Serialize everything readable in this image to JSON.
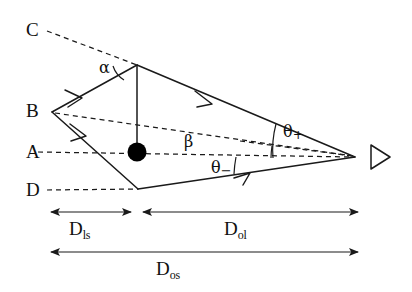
{
  "figure": {
    "type": "ray-diagram",
    "background_color": "#ffffff",
    "line_color": "#1a1a1a",
    "lens_color": "#000000",
    "width": 412,
    "height": 292
  },
  "plane_labels": {
    "c": "C",
    "b": "B",
    "a": "A",
    "d": "D"
  },
  "angle_labels": {
    "alpha": "α",
    "beta": "β",
    "theta_plus_symbol": "θ",
    "theta_plus_sign": "+",
    "theta_minus_symbol": "θ",
    "theta_minus_sign": "−"
  },
  "distance_labels": {
    "d_ls_main": "D",
    "d_ls_sub": "ls",
    "d_ol_main": "D",
    "d_ol_sub": "ol",
    "d_os_main": "D",
    "d_os_sub": "os"
  },
  "elements": {
    "lens_mass": "black-filled-circle-lens",
    "observer": "eye-triangle-observer",
    "source_ray_upper": "deflected-ray-upper",
    "source_ray_lower": "deflected-ray-lower",
    "optical_axis": "dashed-optical-axis",
    "apparent_image_upper": "dashed-line-to-C",
    "apparent_image_lower": "dashed-line-to-D",
    "true_source_line": "dashed-line-to-B"
  },
  "geometry": {
    "source_point": [
      52,
      112
    ],
    "lens_center": [
      137,
      152
    ],
    "upper_deflection_point": [
      137,
      65
    ],
    "lower_deflection_point": [
      138,
      189
    ],
    "observer_point": [
      355,
      157
    ],
    "plane_c_y": 31,
    "plane_b_y": 112,
    "plane_a_y": 152,
    "plane_d_y": 190,
    "d_ls_span": [
      49,
      133
    ],
    "d_ol_span": [
      141,
      360
    ],
    "d_os_span": [
      49,
      360
    ]
  }
}
